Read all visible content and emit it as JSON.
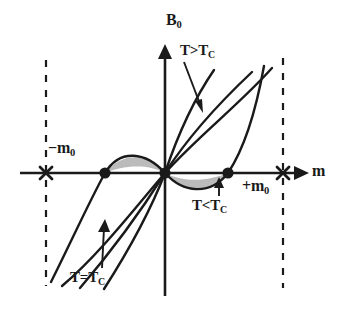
{
  "figure": {
    "name": "mean-field-magnetization-isotherms",
    "background_color": "#ffffff",
    "ink_color": "#1a1a1a",
    "shade_color": "#b9b9b9"
  },
  "axes": {
    "vertical": {
      "label_main": "B",
      "label_sub": "0",
      "label_full": "B0",
      "x": 165,
      "y_top": 50,
      "y_bottom": 296,
      "arrow": "up"
    },
    "horizontal": {
      "label_main": "m",
      "label_sub": "",
      "label_full": "m",
      "y": 173,
      "x_left": 20,
      "x_right": 302,
      "arrow": "right"
    }
  },
  "markers": {
    "x_marks": [
      {
        "name": "x-mark-negative-m0",
        "x": 46,
        "y": 173,
        "label_main": "−m",
        "label_sub": "0",
        "label_full": "-m0"
      },
      {
        "name": "x-mark-positive-m0",
        "x": 283,
        "y": 173,
        "label_main": "+m",
        "label_sub": "0",
        "label_full": "+m0"
      }
    ],
    "dots": [
      {
        "name": "dot-left-spinodal",
        "x": 105,
        "y": 173
      },
      {
        "name": "dot-origin",
        "x": 165,
        "y": 173
      },
      {
        "name": "dot-right-spinodal",
        "x": 228,
        "y": 173
      }
    ],
    "dashed_lines": [
      {
        "name": "dashed-line-negative-m0",
        "x": 46,
        "y_top": 60,
        "y_bottom": 286
      },
      {
        "name": "dashed-line-positive-m0",
        "x": 283,
        "y_top": 58,
        "y_bottom": 288
      }
    ]
  },
  "labels": {
    "b0": {
      "main": "B",
      "sub": "0"
    },
    "m_axis": {
      "main": "m",
      "sub": ""
    },
    "t_greater": {
      "text": "T>T",
      "sub": "C",
      "full": "T>TC"
    },
    "t_less": {
      "text": "T<T",
      "sub": "C",
      "full": "T<TC"
    },
    "t_equal": {
      "text": "T=T",
      "sub": "C",
      "full": "T=TC"
    },
    "m_negative": {
      "main": "−m",
      "sub": "0"
    },
    "m_positive": {
      "main": "+m",
      "sub": "0"
    }
  },
  "curves": [
    {
      "name": "curve-t-greater-than-tc",
      "regime": "T>TC",
      "description": "monotonic steep isotherm, leftmost of the high-T family"
    },
    {
      "name": "curve-t-greater-than-tc-2",
      "regime": "T>TC",
      "description": "second monotonic isotherm, shallower"
    },
    {
      "name": "curve-t-equal-tc",
      "regime": "T=TC",
      "description": "critical isotherm with inflection at origin"
    },
    {
      "name": "curve-t-less-than-tc",
      "regime": "T<TC",
      "description": "non-monotonic van der Waals loop with unstable branch"
    }
  ],
  "shaded_regions": [
    {
      "name": "shaded-lobe-left",
      "side": "left-of-origin",
      "description": "Maxwell equal-area lobe above axis"
    },
    {
      "name": "shaded-lobe-right",
      "side": "right-of-origin",
      "description": "Maxwell equal-area lobe below axis"
    }
  ],
  "annotation_arrows": [
    {
      "name": "annotation-arrow-t-greater",
      "from": "T>TC label",
      "to": "steep isotherm",
      "direction": "down-right"
    },
    {
      "name": "annotation-arrow-t-less",
      "from": "T<TC label",
      "to": "lower loop branch",
      "direction": "up"
    },
    {
      "name": "annotation-arrow-t-equal",
      "from": "T=TC label",
      "to": "critical isotherm",
      "direction": "up"
    }
  ]
}
